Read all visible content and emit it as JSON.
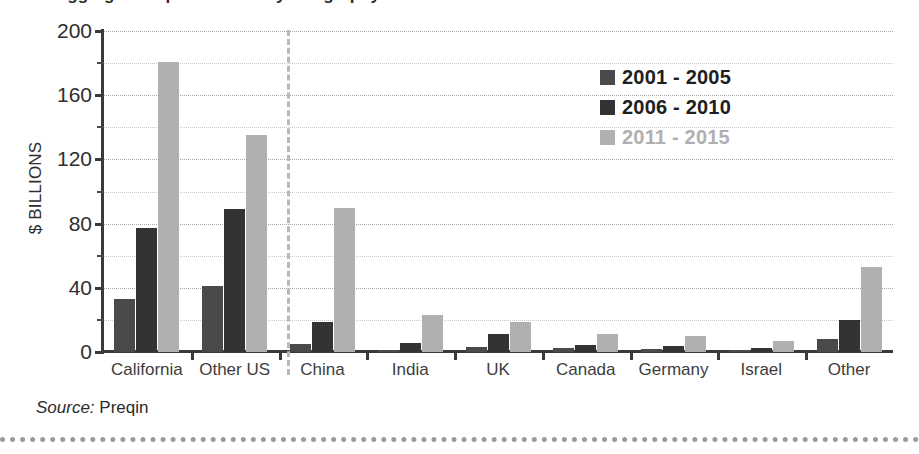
{
  "title_sliver": "Aggregate Capital Raised by Geography",
  "axis": {
    "y_title": "$ BILLIONS",
    "y_ticks": [
      "0",
      "40",
      "80",
      "120",
      "160",
      "200"
    ]
  },
  "legend": {
    "items": [
      {
        "label": "2001 - 2005",
        "color": "#4a4a4a",
        "faded": false
      },
      {
        "label": "2006 - 2010",
        "color": "#333333",
        "faded": false
      },
      {
        "label": "2011 - 2015",
        "color": "#b0b0b0",
        "faded": true
      }
    ]
  },
  "source": {
    "label": "Source:",
    "value": "Preqin"
  },
  "chart_data": {
    "type": "bar",
    "title": "Aggregate Capital Raised by Geography",
    "xlabel": "",
    "ylabel": "$ BILLIONS",
    "ylim": [
      0,
      200
    ],
    "ytick_step": 40,
    "minor_tick_step": 20,
    "grid": true,
    "legend_position": "upper-right",
    "annotations": [
      "dashed vertical separator between 'Other US' and 'China' (US vs. rest of world)"
    ],
    "categories": [
      "California",
      "Other US",
      "China",
      "India",
      "UK",
      "Canada",
      "Germany",
      "Israel",
      "Other"
    ],
    "series": [
      {
        "name": "2001 - 2005",
        "color": "#4a4a4a",
        "values": [
          33,
          41,
          5,
          1.5,
          3,
          2.5,
          2,
          1.5,
          8
        ]
      },
      {
        "name": "2006 - 2010",
        "color": "#333333",
        "values": [
          77,
          89,
          19,
          5.5,
          11,
          4.5,
          3.5,
          2.5,
          20
        ]
      },
      {
        "name": "2011 - 2015",
        "color": "#b0b0b0",
        "values": [
          181,
          135,
          90,
          23,
          19,
          11,
          10,
          7,
          53
        ]
      }
    ]
  }
}
